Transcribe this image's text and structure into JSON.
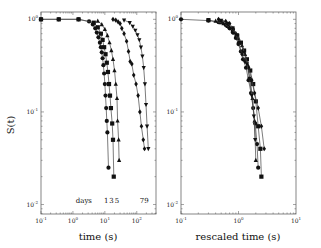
{
  "chart_data": [
    {
      "type": "line",
      "panel": "left",
      "title": "",
      "xlabel": "time (s)",
      "ylabel": "S(t)",
      "xscale": "log",
      "yscale": "log",
      "xlim": [
        0.1,
        400
      ],
      "ylim": [
        0.0079,
        1.2
      ],
      "xticks": [
        {
          "value": 0.1,
          "label": "10",
          "exp": "-1"
        },
        {
          "value": 1,
          "label": "10",
          "exp": "0"
        },
        {
          "value": 10,
          "label": "10",
          "exp": "1"
        },
        {
          "value": 100,
          "label": "10",
          "exp": "2"
        }
      ],
      "yticks": [
        {
          "value": 1,
          "label": "10",
          "exp": "0"
        },
        {
          "value": 0.1,
          "label": "10",
          "exp": "-1"
        },
        {
          "value": 0.01,
          "label": "10",
          "exp": "-2"
        }
      ],
      "grid": false,
      "annotations": [
        {
          "text": "days",
          "x": 2.2,
          "y": 0.0105
        },
        {
          "text": "1",
          "x": 11,
          "y": 0.0105
        },
        {
          "text": "3",
          "x": 16,
          "y": 0.0105
        },
        {
          "text": "5",
          "x": 24,
          "y": 0.0105
        },
        {
          "text": "79",
          "x": 170,
          "y": 0.0105
        }
      ],
      "series": [
        {
          "name": "1 day",
          "marker": "circle",
          "x": [
            0.1,
            0.36,
            1.5,
            3.2,
            4.2,
            5.0,
            5.6,
            6.3,
            7.0,
            7.5,
            8.0,
            8.5,
            9.0,
            9.5,
            10.0,
            10.5,
            11.0,
            11.5,
            12.0,
            13.0
          ],
          "y": [
            1.0,
            1.0,
            1.0,
            0.95,
            0.88,
            0.8,
            0.72,
            0.64,
            0.56,
            0.5,
            0.44,
            0.38,
            0.32,
            0.26,
            0.2,
            0.15,
            0.11,
            0.08,
            0.06,
            0.025
          ]
        },
        {
          "name": "3 days",
          "marker": "square",
          "x": [
            0.1,
            0.36,
            1.5,
            4.5,
            6.0,
            7.5,
            8.5,
            9.5,
            10.5,
            11.5,
            12.5,
            13.5,
            14.5,
            15.5,
            17.0,
            18.0,
            19.0
          ],
          "y": [
            1.0,
            1.0,
            1.0,
            0.92,
            0.82,
            0.7,
            0.6,
            0.5,
            0.42,
            0.34,
            0.27,
            0.2,
            0.15,
            0.11,
            0.075,
            0.05,
            0.02
          ]
        },
        {
          "name": "5 days",
          "marker": "triangle-up",
          "x": [
            6.0,
            8.0,
            10.0,
            12.0,
            14.0,
            16.0,
            18.0,
            20.0,
            22.0,
            24.0,
            25.0,
            27.0,
            28.0
          ],
          "y": [
            0.96,
            0.88,
            0.78,
            0.67,
            0.56,
            0.46,
            0.37,
            0.28,
            0.2,
            0.14,
            0.08,
            0.05,
            0.03
          ]
        },
        {
          "name": "7 days",
          "marker": "diamond",
          "x": [
            18.0,
            22.0,
            26.0,
            30.0,
            34.0,
            40.0,
            48.0,
            55.0,
            62.0,
            70.0,
            80.0,
            95.0,
            110.0,
            125.0,
            140.0,
            160.0,
            175.0
          ],
          "y": [
            1.0,
            0.98,
            0.94,
            0.9,
            0.8,
            0.7,
            0.58,
            0.45,
            0.35,
            0.33,
            0.25,
            0.2,
            0.15,
            0.1,
            0.07,
            0.05,
            0.04
          ]
        },
        {
          "name": "9 days",
          "marker": "triangle-down",
          "x": [
            40.0,
            60.0,
            75.0,
            90.0,
            105.0,
            120.0,
            135.0,
            150.0,
            165.0,
            180.0,
            195.0,
            210.0,
            230.0
          ],
          "y": [
            0.98,
            0.92,
            0.84,
            0.76,
            0.68,
            0.6,
            0.5,
            0.4,
            0.3,
            0.2,
            0.12,
            0.07,
            0.04
          ]
        }
      ]
    },
    {
      "type": "line",
      "panel": "right",
      "title": "",
      "xlabel": "rescaled time (s)",
      "ylabel": "",
      "xscale": "log",
      "yscale": "log",
      "xlim": [
        0.1,
        10
      ],
      "ylim": [
        0.0079,
        1.2
      ],
      "xticks": [
        {
          "value": 0.1,
          "label": "10",
          "exp": "-1"
        },
        {
          "value": 1,
          "label": "10",
          "exp": "0"
        },
        {
          "value": 10,
          "label": "10",
          "exp": "1"
        }
      ],
      "yticks": [
        {
          "value": 1,
          "label": "10",
          "exp": "0"
        },
        {
          "value": 0.1,
          "label": "10",
          "exp": "-1"
        },
        {
          "value": 0.01,
          "label": "10",
          "exp": "-2"
        }
      ],
      "grid": false,
      "series": [
        {
          "name": "1 day",
          "marker": "circle",
          "x": [
            0.1,
            0.3,
            0.45,
            0.6,
            0.7,
            0.8,
            0.9,
            1.0,
            1.1,
            1.2,
            1.35,
            1.5,
            1.65,
            1.8,
            1.95,
            2.1,
            2.2
          ],
          "y": [
            1.0,
            0.97,
            0.93,
            0.87,
            0.8,
            0.72,
            0.63,
            0.54,
            0.45,
            0.37,
            0.3,
            0.22,
            0.16,
            0.11,
            0.075,
            0.045,
            0.025
          ]
        },
        {
          "name": "3 days",
          "marker": "square",
          "x": [
            0.3,
            0.5,
            0.65,
            0.8,
            0.95,
            1.1,
            1.25,
            1.4,
            1.6,
            1.8,
            2.0,
            2.2,
            2.4,
            2.5
          ],
          "y": [
            0.98,
            0.93,
            0.85,
            0.76,
            0.66,
            0.56,
            0.46,
            0.37,
            0.28,
            0.2,
            0.13,
            0.07,
            0.04,
            0.02
          ]
        },
        {
          "name": "5 days",
          "marker": "triangle-up",
          "x": [
            0.4,
            0.55,
            0.7,
            0.85,
            1.0,
            1.15,
            1.3,
            1.45,
            1.6,
            1.75,
            1.9,
            2.0
          ],
          "y": [
            0.96,
            0.9,
            0.82,
            0.72,
            0.62,
            0.52,
            0.42,
            0.32,
            0.22,
            0.14,
            0.08,
            0.03
          ]
        },
        {
          "name": "7 days",
          "marker": "diamond",
          "x": [
            0.45,
            0.6,
            0.7,
            0.8,
            0.9,
            1.0,
            1.15,
            1.3,
            1.5,
            1.7,
            1.9,
            2.2,
            2.5,
            2.8
          ],
          "y": [
            1.0,
            0.95,
            0.9,
            0.8,
            0.7,
            0.56,
            0.42,
            0.35,
            0.3,
            0.22,
            0.16,
            0.11,
            0.07,
            0.04
          ]
        },
        {
          "name": "9 days",
          "marker": "triangle-down",
          "x": [
            0.5,
            0.65,
            0.8,
            0.95,
            1.1,
            1.25,
            1.4,
            1.55,
            1.7,
            1.85,
            1.95
          ],
          "y": [
            0.97,
            0.9,
            0.8,
            0.68,
            0.56,
            0.44,
            0.33,
            0.23,
            0.15,
            0.09,
            0.05
          ]
        }
      ]
    }
  ],
  "layout": {
    "panels": [
      {
        "left": 41,
        "top": 12,
        "right": 156,
        "bottom": 214
      },
      {
        "left": 181,
        "top": 12,
        "right": 296,
        "bottom": 214
      }
    ],
    "colors": {
      "line": "#444444",
      "marker": "#111111",
      "frame": "#666666",
      "background": "#ffffff"
    }
  }
}
